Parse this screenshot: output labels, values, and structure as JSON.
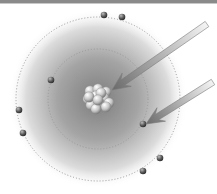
{
  "diagram": {
    "type": "atom-model",
    "colors": {
      "top_rule": "#8a8a8a",
      "cloud_center": "#8c8c8c",
      "cloud_edge": "#ffffff",
      "orbit": "#9a9a9a",
      "electron": "#555555",
      "arrow_light": "#f4f4f4",
      "arrow_dark": "#6a6a6a"
    },
    "center": [
      98,
      99
    ],
    "cloud_radius": 90,
    "orbits": [
      {
        "name": "outer-orbit",
        "r": 82
      },
      {
        "name": "inner-orbit",
        "r": 50
      }
    ],
    "nucleus": {
      "cx": 98,
      "cy": 98,
      "r": 15
    },
    "electrons": [
      {
        "x": 104,
        "y": 15
      },
      {
        "x": 122,
        "y": 17
      },
      {
        "x": 51,
        "y": 80
      },
      {
        "x": 19,
        "y": 110
      },
      {
        "x": 23,
        "y": 133
      },
      {
        "x": 143,
        "y": 124
      },
      {
        "x": 160,
        "y": 158
      },
      {
        "x": 143,
        "y": 171
      }
    ],
    "arrows": [
      {
        "name": "nucleus-pointer-arrow",
        "from": [
          207,
          24
        ],
        "to": [
          112,
          90
        ]
      },
      {
        "name": "electron-pointer-arrow",
        "from": [
          213,
          82
        ],
        "to": [
          146,
          124
        ]
      }
    ]
  }
}
